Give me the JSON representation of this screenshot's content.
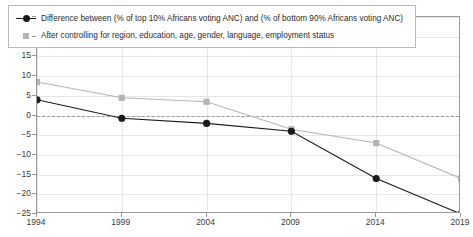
{
  "chart_data": {
    "type": "line",
    "title": "",
    "subtitle": "",
    "xlabel": "",
    "ylabel": "",
    "x": [
      1994,
      1999,
      2004,
      2009,
      2014,
      2019
    ],
    "xticklabels": [
      "1994",
      "1999",
      "2004",
      "2009",
      "2014",
      "2019"
    ],
    "yticklabels": [
      "25",
      "20",
      "15",
      "10",
      "5",
      "0",
      "-5",
      "-10",
      "-15",
      "-20",
      "-25"
    ],
    "ytickvalues": [
      25,
      20,
      15,
      10,
      5,
      0,
      -5,
      -10,
      -15,
      -20,
      -25
    ],
    "ylim": [
      -25,
      25
    ],
    "xlim": [
      1994,
      2019
    ],
    "grid": true,
    "zero_line": true,
    "legend_position": "top-left",
    "series": [
      {
        "name": "Difference between (% of top 10% Africans voting ANC) and (% of bottom 90% Africans voting ANC)",
        "color": "#1a1a1a",
        "marker": "circle",
        "values": [
          4.0,
          -0.7,
          -2.0,
          -4.0,
          -16.0,
          -25.0
        ]
      },
      {
        "name": "After controlling for region, education, age, gender, language, employment status",
        "color": "#b5b5b5",
        "marker": "square",
        "values": [
          8.5,
          4.5,
          3.5,
          -3.5,
          -7.0,
          -16.0
        ]
      }
    ]
  },
  "colors": {
    "series_black": "#1a1a1a",
    "series_gray": "#b5b5b5",
    "grid": "#e6e6e6",
    "axis": "#9a9a9a",
    "zero_dash": "#9b9b9b",
    "background": "#ffffff",
    "tick_text": "#3b3b3b"
  }
}
